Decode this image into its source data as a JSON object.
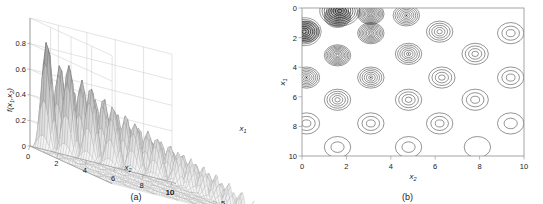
{
  "figure": {
    "panels": [
      {
        "id": "a",
        "caption": "(a)",
        "type": "surface3d",
        "zlabel": "f(x",
        "zlabel_sub1": "1",
        "zlabel_mid": ",x",
        "zlabel_sub2": "2",
        "zlabel_end": ")",
        "xlabel": "x",
        "xlabel_sub": "2",
        "ylabel": "x",
        "ylabel_sub": "1",
        "zticks": [
          "0",
          "0.2",
          "0.4",
          "0.6",
          "0.8"
        ],
        "xticks": [
          "0",
          "2",
          "4",
          "6",
          "8",
          "10"
        ],
        "yticks": [
          "0",
          "5",
          "10"
        ],
        "corner_tick": "10"
      },
      {
        "id": "b",
        "caption": "(b)",
        "type": "contour",
        "xlabel": "x",
        "xlabel_sub": "2",
        "ylabel": "x",
        "ylabel_sub": "1",
        "xticks": [
          "0",
          "2",
          "4",
          "6",
          "8",
          "10"
        ],
        "yticks": [
          "0",
          "2",
          "4",
          "6",
          "8",
          "10"
        ]
      }
    ]
  },
  "chart_data": [
    {
      "type": "surface",
      "panel": "a",
      "title": "",
      "xlabel": "x2",
      "ylabel": "x1",
      "zlabel": "f(x1,x2)",
      "xlim": [
        0,
        10
      ],
      "ylim": [
        0,
        10
      ],
      "zlim": [
        0,
        1.0
      ],
      "zticks": [
        0,
        0.2,
        0.4,
        0.6,
        0.8
      ],
      "xticks": [
        0,
        2,
        4,
        6,
        8,
        10
      ],
      "yticks": [
        0,
        5,
        10
      ],
      "grid": true,
      "surface_style": "wireframe-mesh-gray",
      "description": "Multimodal function with regular lattice of peaks whose amplitude decays with distance from the origin; tallest peaks near x1=0, x2=3 reach about 1.0",
      "peak_spacing": 1.55,
      "peak_amplitudes": {
        "max": 1.0,
        "min": 0.12,
        "decay": "amplitude decreases monotonically as x1 and x2 increase"
      }
    },
    {
      "type": "contour",
      "panel": "b",
      "title": "",
      "xlabel": "x2",
      "ylabel": "x1",
      "xlim": [
        0,
        10
      ],
      "ylim": [
        0,
        10
      ],
      "y_inverted": true,
      "xticks": [
        0,
        2,
        4,
        6,
        8,
        10
      ],
      "yticks": [
        0,
        2,
        4,
        6,
        8,
        10
      ],
      "grid": false,
      "legend": "none",
      "contour_color": "#2b2b2b",
      "description": "Contour map of the same function: concentric closed rings centred on a lattice of local maxima spaced about 1.55 units apart; ring count (and darkness) is greatest in the upper-left corner and decreases toward the lower-right",
      "peak_lattice": {
        "x2_centers": [
          0.0,
          1.55,
          3.1,
          4.65,
          6.2,
          7.75,
          9.3
        ],
        "x1_centers": [
          0.0,
          1.55,
          3.1,
          4.65,
          6.2,
          7.75,
          9.3
        ]
      },
      "peaks": [
        {
          "x2": 1.6,
          "x1": 0.6,
          "rings": 11,
          "level_max": 1.0
        },
        {
          "x2": 3.1,
          "x1": 0.4,
          "rings": 10,
          "level_max": 0.98
        },
        {
          "x2": 0.2,
          "x1": 1.6,
          "rings": 9,
          "level_max": 0.92
        },
        {
          "x2": 3.1,
          "x1": 1.7,
          "rings": 9,
          "level_max": 0.9
        },
        {
          "x2": 4.7,
          "x1": 0.5,
          "rings": 7,
          "level_max": 0.8
        },
        {
          "x2": 1.6,
          "x1": 3.2,
          "rings": 9,
          "level_max": 0.88
        },
        {
          "x2": 4.8,
          "x1": 3.1,
          "rings": 6,
          "level_max": 0.72
        },
        {
          "x2": 6.2,
          "x1": 1.6,
          "rings": 5,
          "level_max": 0.66
        },
        {
          "x2": 0.2,
          "x1": 4.7,
          "rings": 7,
          "level_max": 0.74
        },
        {
          "x2": 3.1,
          "x1": 4.7,
          "rings": 6,
          "level_max": 0.68
        },
        {
          "x2": 6.3,
          "x1": 4.7,
          "rings": 4,
          "level_max": 0.52
        },
        {
          "x2": 9.4,
          "x1": 1.7,
          "rings": 3,
          "level_max": 0.42
        },
        {
          "x2": 7.8,
          "x1": 3.1,
          "rings": 4,
          "level_max": 0.48
        },
        {
          "x2": 1.6,
          "x1": 6.2,
          "rings": 5,
          "level_max": 0.58
        },
        {
          "x2": 4.8,
          "x1": 6.2,
          "rings": 4,
          "level_max": 0.5
        },
        {
          "x2": 7.8,
          "x1": 6.2,
          "rings": 3,
          "level_max": 0.4
        },
        {
          "x2": 9.4,
          "x1": 4.7,
          "rings": 3,
          "level_max": 0.38
        },
        {
          "x2": 0.2,
          "x1": 7.8,
          "rings": 3,
          "level_max": 0.4
        },
        {
          "x2": 3.1,
          "x1": 7.8,
          "rings": 3,
          "level_max": 0.36
        },
        {
          "x2": 6.2,
          "x1": 7.8,
          "rings": 3,
          "level_max": 0.32
        },
        {
          "x2": 9.4,
          "x1": 7.8,
          "rings": 2,
          "level_max": 0.26
        },
        {
          "x2": 1.6,
          "x1": 9.4,
          "rings": 2,
          "level_max": 0.28
        },
        {
          "x2": 4.8,
          "x1": 9.4,
          "rings": 2,
          "level_max": 0.24
        },
        {
          "x2": 7.9,
          "x1": 9.4,
          "rings": 1,
          "level_max": 0.18
        }
      ]
    }
  ]
}
